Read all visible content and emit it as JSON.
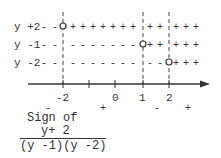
{
  "diagram": {
    "type": "sign-chart",
    "rows": [
      {
        "label": "y +2",
        "root": -2,
        "signs_left": "-",
        "signs_right": "+"
      },
      {
        "label": "y -1",
        "root": 1,
        "signs_left": "-",
        "signs_right": "+"
      },
      {
        "label": "y -2",
        "root": 2,
        "signs_left": "-",
        "signs_right": "+"
      }
    ],
    "critical_points": [
      -2,
      1,
      2
    ],
    "axis": {
      "tick_labels": [
        {
          "value": -2,
          "label": "-2"
        },
        {
          "value": -1,
          "label": ""
        },
        {
          "value": 0,
          "label": "0"
        },
        {
          "value": 1,
          "label": "1"
        },
        {
          "value": 2,
          "label": "2"
        }
      ]
    },
    "interval_signs": [
      {
        "interval": "(-inf,-2)",
        "sign": "-"
      },
      {
        "interval": "(-2,1)",
        "sign": "+"
      },
      {
        "interval": "(1,2)",
        "sign": "-"
      },
      {
        "interval": "(2,inf)",
        "sign": "+"
      }
    ],
    "caption": {
      "title": "Sign of",
      "numerator": "y+ 2",
      "denominator": "(y -1)(y -2)"
    }
  }
}
